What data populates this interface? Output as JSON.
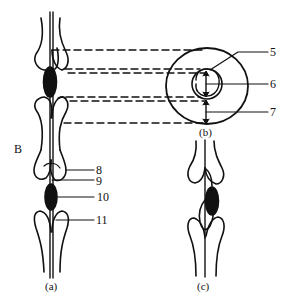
{
  "figure": {
    "side_label": "B",
    "panels": {
      "a": {
        "caption": "(a)"
      },
      "b": {
        "caption": "(b)"
      },
      "c": {
        "caption": "(c)"
      }
    },
    "callouts": [
      {
        "id": "5",
        "label": "5"
      },
      {
        "id": "6",
        "label": "6"
      },
      {
        "id": "7",
        "label": "7"
      },
      {
        "id": "8",
        "label": "8"
      },
      {
        "id": "9",
        "label": "9"
      },
      {
        "id": "10",
        "label": "10"
      },
      {
        "id": "11",
        "label": "11"
      }
    ],
    "colors": {
      "ink": "#111111",
      "background": "#ffffff"
    }
  }
}
